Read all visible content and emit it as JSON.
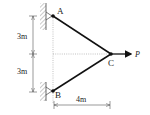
{
  "diagram": {
    "type": "truss",
    "nodes": {
      "A": {
        "label": "A",
        "support": "pin"
      },
      "B": {
        "label": "B",
        "support": "pin"
      },
      "C": {
        "label": "C",
        "support": "free"
      }
    },
    "members": [
      {
        "from": "A",
        "to": "C"
      },
      {
        "from": "B",
        "to": "C"
      }
    ],
    "load": {
      "node": "C",
      "label": "P",
      "direction": "right"
    },
    "dimensions": {
      "upper_vertical": "3m",
      "lower_vertical": "3m",
      "horizontal": "4m"
    },
    "colors": {
      "member": "#111111",
      "dimension": "#555555",
      "hatch": "#666666"
    }
  }
}
